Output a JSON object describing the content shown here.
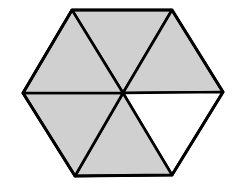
{
  "diagram": {
    "shape": "regular-hexagon",
    "divisions": 6,
    "shaded_count": 5,
    "unshaded_count": 1,
    "shaded_fraction": "5/6",
    "colors": {
      "shaded": "#d0d0d0",
      "unshaded": "#ffffff",
      "stroke": "#000000"
    },
    "vertices": {
      "top_left": [
        72,
        10
      ],
      "top_right": [
        172,
        10
      ],
      "right": [
        223,
        92
      ],
      "bottom_right": [
        172,
        175
      ],
      "bottom_left": [
        75,
        176
      ],
      "left": [
        23,
        93
      ],
      "center": [
        123,
        93
      ]
    },
    "triangles": [
      {
        "name": "top",
        "shaded": true
      },
      {
        "name": "upper-right",
        "shaded": true
      },
      {
        "name": "lower-right",
        "shaded": false
      },
      {
        "name": "bottom",
        "shaded": true
      },
      {
        "name": "lower-left",
        "shaded": true
      },
      {
        "name": "upper-left",
        "shaded": true
      }
    ]
  }
}
